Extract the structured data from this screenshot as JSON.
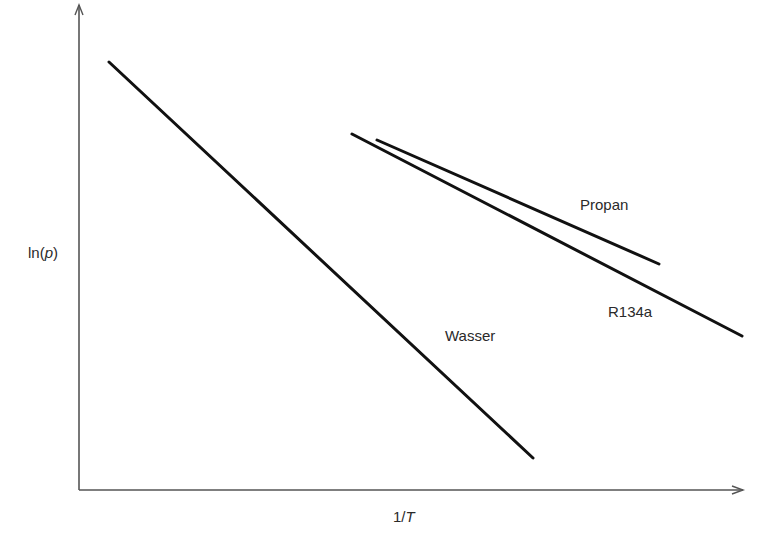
{
  "chart_data": {
    "type": "line",
    "title": "",
    "xlabel": "1/T",
    "ylabel": "ln(p)",
    "xlabel_parts": {
      "prefix": "1/",
      "var": "T"
    },
    "ylabel_parts": {
      "prefix": "ln(",
      "var": "p",
      "suffix": ")"
    },
    "grid": false,
    "legend": "inline labels",
    "axes": {
      "origin": [
        79,
        490
      ],
      "x_end": [
        743,
        490
      ],
      "y_end": [
        79,
        5
      ],
      "color": "#555555"
    },
    "series": [
      {
        "name": "Wasser",
        "label": "Wasser",
        "start": [
          109,
          62
        ],
        "end": [
          533,
          458
        ],
        "label_pos": [
          445,
          327
        ]
      },
      {
        "name": "R134a",
        "label": "R134a",
        "start": [
          352,
          134
        ],
        "end": [
          742,
          336
        ],
        "label_pos": [
          608,
          303
        ]
      },
      {
        "name": "Propan",
        "label": "Propan",
        "start": [
          377,
          140
        ],
        "end": [
          659,
          264
        ],
        "label_pos": [
          580,
          196
        ]
      }
    ],
    "line_color": "#111111"
  }
}
